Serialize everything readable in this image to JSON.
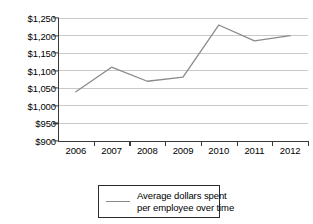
{
  "chart_data": {
    "type": "line",
    "title": "",
    "xlabel": "",
    "ylabel": "",
    "categories": [
      "2006",
      "2007",
      "2008",
      "2009",
      "2010",
      "2011",
      "2012"
    ],
    "values": [
      1040,
      1110,
      1070,
      1082,
      1230,
      1185,
      1200
    ],
    "series": [
      {
        "name": "Average dollars spent per employee over time",
        "values": [
          1040,
          1110,
          1070,
          1082,
          1230,
          1185,
          1200
        ]
      }
    ],
    "ylim": [
      900,
      1250
    ],
    "ytick_values": [
      1250,
      1200,
      1150,
      1100,
      1050,
      1000,
      950,
      900
    ],
    "ytick_labels": [
      "$1,250",
      "$1,200",
      "$1,150",
      "$1,100",
      "$1,050",
      "$1,000",
      "$950",
      "$900"
    ],
    "grid": true,
    "grid_axis": "y",
    "legend_position": "bottom",
    "line_color": "#8a8a8a",
    "grid_color": "#c9c9c9",
    "axis_color": "#3a3a3a",
    "background_color": "#ffffff"
  },
  "legend": {
    "entries": [
      {
        "line1": "Average dollars spent",
        "line2": "per employee over time",
        "swatch": "line-swatch"
      }
    ]
  }
}
